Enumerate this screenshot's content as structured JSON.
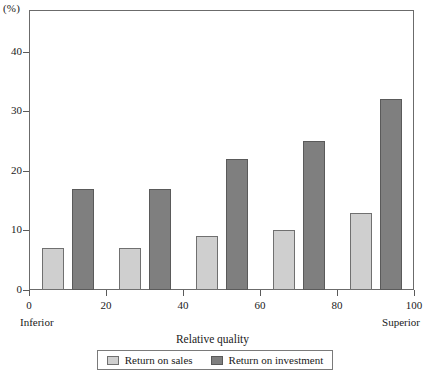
{
  "chart_data": {
    "type": "bar",
    "title": "",
    "subtitle": "",
    "xlabel": "Relative quality",
    "ylabel": "(%)",
    "unit_label": "(%)",
    "grid": false,
    "legend_position": "bottom",
    "xlim": [
      0,
      100
    ],
    "ylim": [
      0,
      47
    ],
    "yticks": [
      0,
      10,
      20,
      30,
      40
    ],
    "ytick_labels": [
      "0",
      "10",
      "20",
      "30",
      "40"
    ],
    "xticks": [
      0,
      20,
      40,
      60,
      80,
      100
    ],
    "xtick_labels": [
      "0",
      "20",
      "40",
      "60",
      "80",
      "100"
    ],
    "x_axis_end_labels": {
      "left": "Inferior",
      "right": "Superior"
    },
    "categories": [
      "1",
      "2",
      "3",
      "4",
      "5"
    ],
    "group_centers": [
      10,
      30,
      50,
      70,
      90
    ],
    "series": [
      {
        "name": "Return on sales",
        "color": "#cfcfcf",
        "values": [
          7,
          7,
          9,
          10,
          13
        ]
      },
      {
        "name": "Return on investment",
        "color": "#7f7f7f",
        "values": [
          17,
          17,
          22,
          25,
          32
        ]
      }
    ],
    "annotations": []
  },
  "legend": {
    "items": [
      {
        "label": "Return on sales",
        "swatch": "sales"
      },
      {
        "label": "Return on investment",
        "swatch": "investment"
      }
    ]
  },
  "colors": {
    "sales": "#cfcfcf",
    "investment": "#7f7f7f",
    "axis": "#5a5a5a",
    "frame": "#6b6b6b",
    "text": "#1a1a1a",
    "background": "#ffffff"
  }
}
